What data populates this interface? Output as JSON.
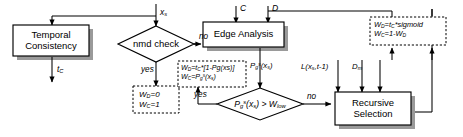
{
  "diagram": {
    "process_nodes": [
      {
        "id": "temporal-consistency",
        "label_line1": "Temporal",
        "label_line2": "Consistency"
      },
      {
        "id": "edge-analysis",
        "label_line1": "Edge Analysis",
        "label_line2": ""
      },
      {
        "id": "recursive-selection",
        "label_line1": "Recursive",
        "label_line2": "Selection"
      }
    ],
    "decision_nodes": [
      {
        "id": "nmd-check",
        "label": "nmd check"
      },
      {
        "id": "threshold-check",
        "label": "Pg(xs) > Wlow"
      }
    ],
    "formula_boxes": [
      {
        "id": "weights-zero-one",
        "line1": "WD=0",
        "line2": "WC=1"
      },
      {
        "id": "weights-edge",
        "line1": "WD=tC*[1-Pg(xs)]",
        "line2": "WC=Pg(xs)"
      },
      {
        "id": "weights-sigmoid",
        "line1": "WD=tC*sigmoid",
        "line2": "WC=1-WD"
      }
    ],
    "edge_labels": [
      {
        "id": "input-xs",
        "text": "xs"
      },
      {
        "id": "input-c",
        "text": "C"
      },
      {
        "id": "input-d",
        "text": "D"
      },
      {
        "id": "output-tc",
        "text": "tC"
      },
      {
        "id": "nmd-no",
        "text": "no"
      },
      {
        "id": "nmd-yes",
        "text": "yes"
      },
      {
        "id": "edge-prob",
        "text": "Pg(xs)"
      },
      {
        "id": "threshold-yes",
        "text": "yes"
      },
      {
        "id": "threshold-no",
        "text": "no"
      },
      {
        "id": "label-prev",
        "text": "L(xs,t-1)"
      },
      {
        "id": "label-dm",
        "text": "Dm"
      }
    ],
    "colors": {
      "stroke": "#000000",
      "fill": "#ffffff",
      "shadow": "#9a9a9a",
      "background": "#ffffff"
    }
  }
}
